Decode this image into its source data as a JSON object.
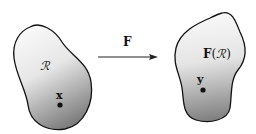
{
  "diagram": {
    "mapping_label": "F",
    "domain_region": {
      "label": "ℛ",
      "point_label": "x"
    },
    "image_region": {
      "label_prefix": "F",
      "label_open": "(",
      "label_region": "ℛ",
      "label_close": ")",
      "point_label": "y"
    },
    "colors": {
      "outline": "#111111",
      "fill_light": "#f4f4f4",
      "fill_dark": "#8a8a8a",
      "arrow": "#222222"
    }
  }
}
